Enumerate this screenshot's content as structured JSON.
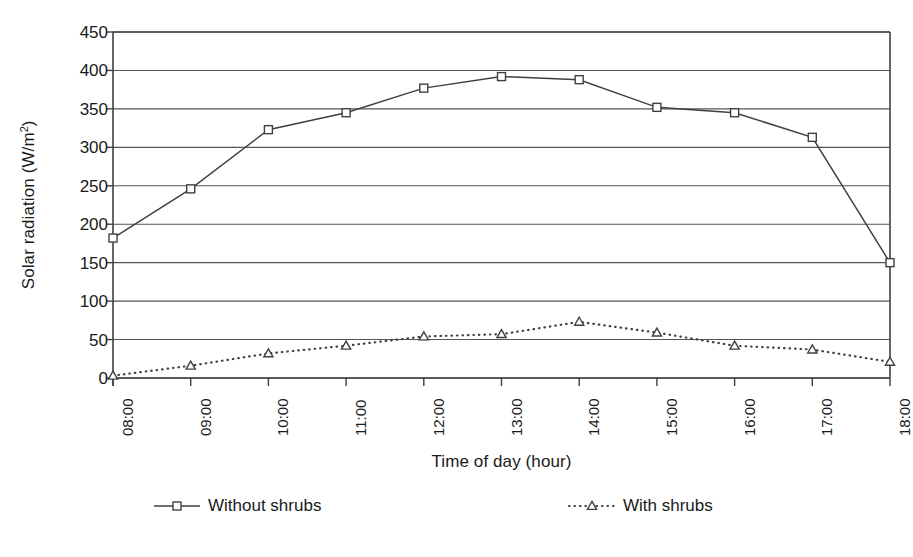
{
  "chart_data": {
    "type": "line",
    "title": "",
    "xlabel": "Time of day (hour)",
    "ylabel": "Solar radiation (W/m²)",
    "ylabel_main": "Solar radiation (W/m",
    "ylabel_sup": "2",
    "ylabel_tail": ")",
    "categories": [
      "08:00",
      "09:00",
      "10:00",
      "11:00",
      "12:00",
      "13:00",
      "14:00",
      "15:00",
      "16:00",
      "17:00",
      "18:00"
    ],
    "yticks": [
      0,
      50,
      100,
      150,
      200,
      250,
      300,
      350,
      400,
      450
    ],
    "ylim": [
      0,
      450
    ],
    "grid": true,
    "legend_position": "bottom",
    "series": [
      {
        "name": "Without shrubs",
        "marker": "square",
        "line_style": "solid",
        "color": "#404040",
        "values": [
          182,
          246,
          323,
          345,
          377,
          392,
          388,
          352,
          345,
          313,
          150
        ]
      },
      {
        "name": "With shrubs",
        "marker": "triangle",
        "line_style": "dotted",
        "color": "#404040",
        "values": [
          3,
          16,
          32,
          42,
          54,
          57,
          73,
          59,
          42,
          37,
          21
        ]
      }
    ]
  },
  "legend": {
    "items": [
      {
        "label": "Without shrubs",
        "marker": "square-marker-icon",
        "style": "solid"
      },
      {
        "label": "With shrubs",
        "marker": "triangle-marker-icon",
        "style": "dotted"
      }
    ]
  },
  "colors": {
    "axis": "#404040",
    "grid": "#555555",
    "text": "#1a1a1a",
    "background": "#ffffff"
  }
}
